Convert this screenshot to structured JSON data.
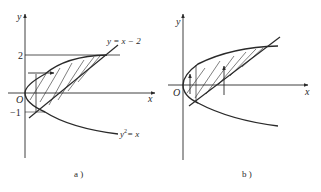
{
  "figure": {
    "panels": [
      {
        "id": "a",
        "caption": "a )",
        "axes": {
          "x_label": "x",
          "y_label": "y",
          "origin_label": "O"
        },
        "ticks": {
          "y_upper": "2",
          "y_lower": "−1"
        },
        "curves": {
          "parabola_label": "y² = x",
          "parabola_base": "y",
          "parabola_exp": "2",
          "parabola_rest": "= x",
          "line_label": "y = x − 2"
        },
        "shading": "region between y² = x and y = x − 2, integrated with horizontal strips (dy)"
      },
      {
        "id": "b",
        "caption": "b )",
        "axes": {
          "x_label": "x",
          "y_label": "y",
          "origin_label": "O"
        },
        "shading": "same region, integrated with vertical strips (dx)"
      }
    ],
    "colors": {
      "ink": "#2a2a2a",
      "background": "#ffffff"
    }
  }
}
